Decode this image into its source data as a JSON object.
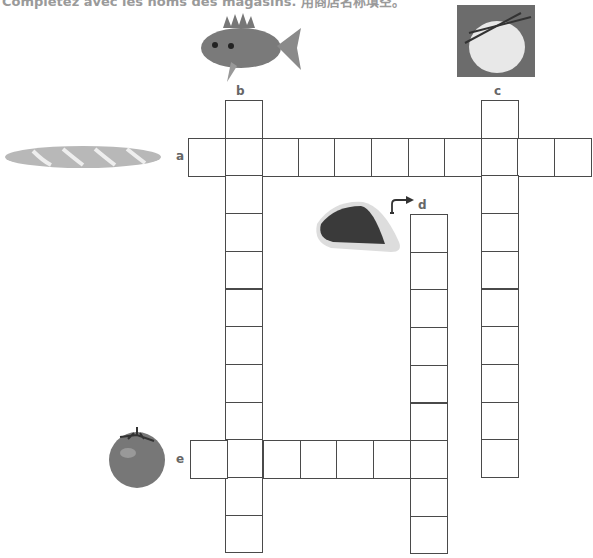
{
  "instruction": "Complétez avec les noms des magasins. 用商店名称填空。",
  "clues": {
    "a": {
      "label": "a",
      "picture": "baguette",
      "direction": "across",
      "length": 11
    },
    "b": {
      "label": "b",
      "picture": "fish",
      "direction": "down",
      "length": 12
    },
    "c": {
      "label": "c",
      "picture": "cheese",
      "direction": "down",
      "length": 10
    },
    "d": {
      "label": "d",
      "picture": "meat",
      "direction": "down",
      "length": 9
    },
    "e": {
      "label": "e",
      "picture": "tomato",
      "direction": "across",
      "length": 7
    }
  }
}
